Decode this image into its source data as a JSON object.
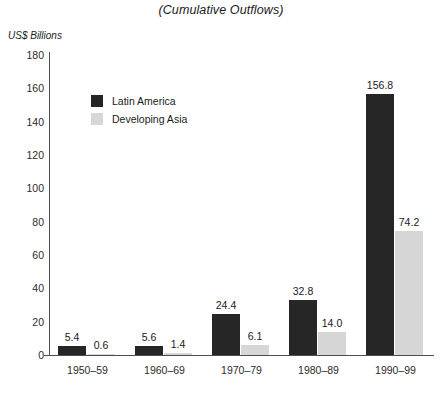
{
  "chart_data": {
    "type": "bar",
    "title": "(Cumulative Outflows)",
    "subtitle": "",
    "xlabel": "",
    "ylabel": "US$ Billions",
    "ylim": [
      0,
      180
    ],
    "ytick_labels": [
      "180",
      "160",
      "140",
      "120",
      "100",
      "80",
      "60",
      "40",
      "20",
      "0"
    ],
    "ytick_values": [
      180,
      160,
      140,
      120,
      100,
      80,
      60,
      40,
      20,
      0
    ],
    "grid": false,
    "legend_position": "inside-top-left",
    "categories": [
      "1950–59",
      "1960–69",
      "1970–79",
      "1980–89",
      "1990–99"
    ],
    "series": [
      {
        "name": "Latin America",
        "color": "#262626",
        "values": [
          5.4,
          5.6,
          24.4,
          32.8,
          156.8
        ],
        "labels": [
          "5.4",
          "5.6",
          "24.4",
          "32.8",
          "156.8"
        ]
      },
      {
        "name": "Developing Asia",
        "color": "#d6d6d6",
        "values": [
          0.6,
          1.4,
          6.1,
          14.0,
          74.2
        ],
        "labels": [
          "0.6",
          "1.4",
          "6.1",
          "14.0",
          "74.2"
        ]
      }
    ]
  },
  "colors": {
    "axis": "#4d4d4d",
    "text": "#1a1a1a",
    "background": "#ffffff"
  }
}
